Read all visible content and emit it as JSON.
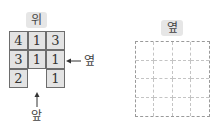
{
  "left_figure": {
    "top_label": "위",
    "side_label": "옆",
    "front_label": "앞",
    "grid": [
      [
        "4",
        "1",
        "3"
      ],
      [
        "3",
        "1",
        "1"
      ],
      [
        "2",
        "",
        "1"
      ]
    ]
  },
  "right_figure": {
    "title": "옆",
    "rows": 4,
    "cols": 4
  },
  "colors": {
    "cell_fill": "#e3e3e3",
    "badge_fill": "#e6e6e6",
    "dashed_line": "#9a9a9a"
  }
}
